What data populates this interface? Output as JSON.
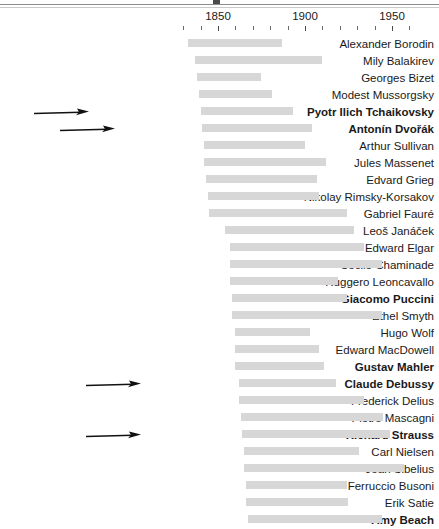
{
  "chart_data": {
    "type": "bar",
    "subtype": "timeline-gantt",
    "title": "",
    "xlabel": "",
    "ylabel": "",
    "xlim": [
      1825,
      1960
    ],
    "grid": false,
    "legend": null,
    "axis": {
      "tick_labels": [
        "1850",
        "1900",
        "1950"
      ],
      "tick_label_values": [
        1850,
        1900,
        1950
      ],
      "minor_tick_interval": 10,
      "minor_tick_values": [
        1830,
        1840,
        1850,
        1860,
        1870,
        1880,
        1890,
        1900,
        1910,
        1920,
        1930,
        1940,
        1950,
        1960
      ],
      "px_per_year": 1.74,
      "origin_px": 218,
      "origin_year": 1850
    },
    "bar_color": "#d7d7d7",
    "highlight_style": "bold",
    "categories": [
      "Alexander Borodin",
      "Mily Balakirev",
      "Georges Bizet",
      "Modest Mussorgsky",
      "Pyotr Ilich Tchaikovsky",
      "Antonín Dvořák",
      "Arthur Sullivan",
      "Jules Massenet",
      "Edvard Grieg",
      "Nikolay Rimsky-Korsakov",
      "Gabriel Fauré",
      "Leoš Janáček",
      "Edward Elgar",
      "Cécile Chaminade",
      "Ruggero Leoncavallo",
      "Giacomo Puccini",
      "Ethel Smyth",
      "Hugo Wolf",
      "Edward MacDowell",
      "Gustav Mahler",
      "Claude Debussy",
      "Frederick Delius",
      "Pietro Mascagni",
      "Richard Strauss",
      "Carl Nielsen",
      "Jean Sibelius",
      "Ferruccio Busoni",
      "Erik Satie",
      "Amy Beach"
    ],
    "rows": [
      {
        "name": "Alexander Borodin",
        "start": 1833,
        "end": 1887,
        "bold": false,
        "arrow": false
      },
      {
        "name": "Mily Balakirev",
        "start": 1837,
        "end": 1910,
        "bold": false,
        "arrow": false
      },
      {
        "name": "Georges Bizet",
        "start": 1838,
        "end": 1875,
        "bold": false,
        "arrow": false
      },
      {
        "name": "Modest Mussorgsky",
        "start": 1839,
        "end": 1881,
        "bold": false,
        "arrow": false
      },
      {
        "name": "Pyotr Ilich Tchaikovsky",
        "start": 1840,
        "end": 1893,
        "bold": true,
        "arrow": true
      },
      {
        "name": "Antonín Dvořák",
        "start": 1841,
        "end": 1904,
        "bold": true,
        "arrow": true
      },
      {
        "name": "Arthur Sullivan",
        "start": 1842,
        "end": 1900,
        "bold": false,
        "arrow": false
      },
      {
        "name": "Jules Massenet",
        "start": 1842,
        "end": 1912,
        "bold": false,
        "arrow": false
      },
      {
        "name": "Edvard Grieg",
        "start": 1843,
        "end": 1907,
        "bold": false,
        "arrow": false
      },
      {
        "name": "Nikolay Rimsky-Korsakov",
        "start": 1844,
        "end": 1908,
        "bold": false,
        "arrow": false
      },
      {
        "name": "Gabriel Fauré",
        "start": 1845,
        "end": 1924,
        "bold": false,
        "arrow": false
      },
      {
        "name": "Leoš Janáček",
        "start": 1854,
        "end": 1928,
        "bold": false,
        "arrow": false
      },
      {
        "name": "Edward Elgar",
        "start": 1857,
        "end": 1934,
        "bold": false,
        "arrow": false
      },
      {
        "name": "Cécile Chaminade",
        "start": 1857,
        "end": 1944,
        "bold": false,
        "arrow": false
      },
      {
        "name": "Ruggero Leoncavallo",
        "start": 1857,
        "end": 1919,
        "bold": false,
        "arrow": false
      },
      {
        "name": "Giacomo Puccini",
        "start": 1858,
        "end": 1924,
        "bold": true,
        "arrow": false
      },
      {
        "name": "Ethel Smyth",
        "start": 1858,
        "end": 1944,
        "bold": false,
        "arrow": false
      },
      {
        "name": "Hugo Wolf",
        "start": 1860,
        "end": 1903,
        "bold": false,
        "arrow": false
      },
      {
        "name": "Edward MacDowell",
        "start": 1860,
        "end": 1908,
        "bold": false,
        "arrow": false
      },
      {
        "name": "Gustav Mahler",
        "start": 1860,
        "end": 1911,
        "bold": true,
        "arrow": false
      },
      {
        "name": "Claude Debussy",
        "start": 1862,
        "end": 1918,
        "bold": true,
        "arrow": true
      },
      {
        "name": "Frederick Delius",
        "start": 1862,
        "end": 1934,
        "bold": false,
        "arrow": false
      },
      {
        "name": "Pietro Mascagni",
        "start": 1863,
        "end": 1945,
        "bold": false,
        "arrow": false
      },
      {
        "name": "Richard Strauss",
        "start": 1864,
        "end": 1949,
        "bold": true,
        "arrow": true
      },
      {
        "name": "Carl Nielsen",
        "start": 1865,
        "end": 1931,
        "bold": false,
        "arrow": false
      },
      {
        "name": "Jean Sibelius",
        "start": 1865,
        "end": 1957,
        "bold": false,
        "arrow": false
      },
      {
        "name": "Ferruccio Busoni",
        "start": 1866,
        "end": 1924,
        "bold": false,
        "arrow": false
      },
      {
        "name": "Erik Satie",
        "start": 1866,
        "end": 1925,
        "bold": false,
        "arrow": false
      },
      {
        "name": "Amy Beach",
        "start": 1867,
        "end": 1944,
        "bold": true,
        "arrow": false
      }
    ]
  }
}
